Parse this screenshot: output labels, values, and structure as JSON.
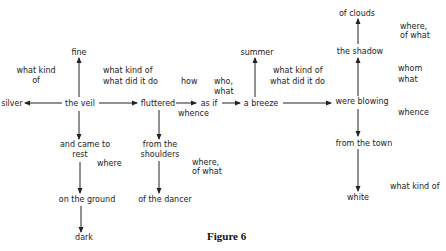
{
  "nodes": {
    "silver": "silver",
    "the_veil": "the veil",
    "fine": "fine",
    "fluttered": "fluttered",
    "as_if": "as if",
    "a_breeze": "a breeze",
    "summer": "summer",
    "were_blowing": "were blowing",
    "the_shadow": "the shadow",
    "of_clouds": "of clouds",
    "from_the_town": "from the town",
    "white": "white",
    "and_came_to_rest_1": "and came to",
    "and_came_to_rest_2": "rest",
    "on_the_ground": "on the ground",
    "dark": "dark",
    "from_the_shoulders_1": "from the",
    "from_the_shoulders_2": "shoulders",
    "of_the_dancer": "of the dancer"
  },
  "questions": {
    "what_kind_of_left_1": "what kind",
    "what_kind_of_left_2": "of",
    "veil_fluttered_1": "what kind of",
    "veil_fluttered_2": "what did it do",
    "how": "how",
    "who_what_1": "who,",
    "who_what_2": "what",
    "whence_asif": "whence",
    "breeze_blowing_1": "what kind of",
    "breeze_blowing_2": "what did it do",
    "where_of_what_top_1": "where,",
    "where_of_what_top_2": "of what",
    "whom": "whom",
    "what": "what",
    "whence_blowing": "whence",
    "where_rest": "where",
    "where_of_what_mid_1": "where,",
    "where_of_what_mid_2": "of what",
    "what_kind_of_white": "what kind of"
  },
  "caption": "Figure 6"
}
